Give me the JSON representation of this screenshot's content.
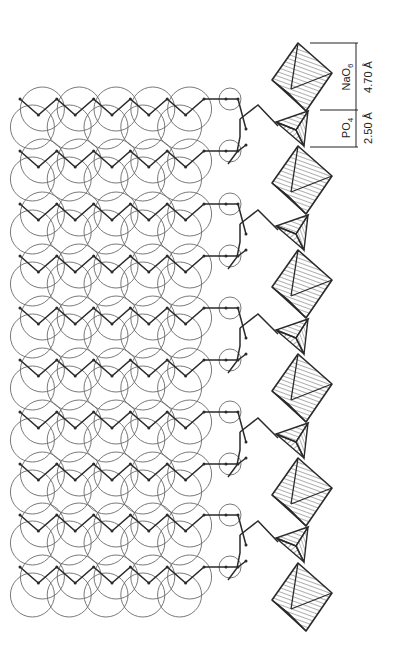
{
  "figure": {
    "ink_color": "#2a2a2a",
    "circle_color": "#6a6a6a",
    "background": "#ffffff"
  },
  "labels": {
    "nao6_formula": "NaO",
    "nao6_subscript": "6",
    "nao6_distance": "4.70 Å",
    "po4_formula": "PO",
    "po4_subscript": "4",
    "po4_distance": "2.50 Å"
  },
  "structure": {
    "chain_pair_y": [
      107,
      212,
      316,
      420,
      523
    ],
    "chain_pair_gap": 52,
    "chain_start_x": 20,
    "zigzag_step_x": 18.4,
    "zigzag_amplitude": 16,
    "zigzag_vertices": 11,
    "circle_radius": 22,
    "polyhedra_column_x": 300,
    "octahedra_y": [
      77,
      180,
      284,
      388,
      492,
      597
    ],
    "tetrahedra_y": [
      128,
      232,
      336,
      440,
      544
    ]
  }
}
